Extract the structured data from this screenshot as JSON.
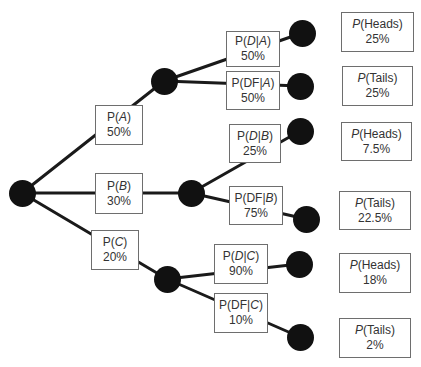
{
  "diagram": {
    "type": "probability-tree",
    "root": {
      "id": "root"
    },
    "level1": [
      {
        "id": "A",
        "label_prefix": "P(",
        "event": "A",
        "label_suffix": ")",
        "value": "50%"
      },
      {
        "id": "B",
        "label_prefix": "P(",
        "event": "B",
        "label_suffix": ")",
        "value": "30%"
      },
      {
        "id": "C",
        "label_prefix": "P(",
        "event": "C",
        "label_suffix": ")",
        "value": "20%"
      }
    ],
    "level2": [
      {
        "id": "D_A",
        "parent": "A",
        "label_prefix": "P(",
        "event": "D",
        "mid": "|",
        "given": "A",
        "label_suffix": ")",
        "value": "50%"
      },
      {
        "id": "DF_A",
        "parent": "A",
        "label_prefix": "P(",
        "event": "DF",
        "mid": "|",
        "given": "A",
        "label_suffix": ")",
        "value": "50%"
      },
      {
        "id": "D_B",
        "parent": "B",
        "label_prefix": "P(",
        "event": "D",
        "mid": "|",
        "given": "B",
        "label_suffix": ")",
        "value": "25%"
      },
      {
        "id": "DF_B",
        "parent": "B",
        "label_prefix": "P(",
        "event": "DF",
        "mid": "|",
        "given": "B",
        "label_suffix": ")",
        "value": "75%"
      },
      {
        "id": "D_C",
        "parent": "C",
        "label_prefix": "P(",
        "event": "D",
        "mid": "|",
        "given": "C",
        "label_suffix": ")",
        "value": "90%"
      },
      {
        "id": "DF_C",
        "parent": "C",
        "label_prefix": "P(",
        "event": "DF",
        "mid": "|",
        "given": "C",
        "label_suffix": ")",
        "value": "10%"
      }
    ],
    "outcomes": [
      {
        "p": "P",
        "label": "(Heads)",
        "value": "25%"
      },
      {
        "p": "P",
        "label": "(Tails)",
        "value": "25%"
      },
      {
        "p": "P",
        "label": "(Heads)",
        "value": "7.5%"
      },
      {
        "p": "P",
        "label": "(Tails)",
        "value": "22.5%"
      },
      {
        "p": "P",
        "label": "(Heads)",
        "value": "18%"
      },
      {
        "p": "P",
        "label": "(Tails)",
        "value": "2%"
      }
    ]
  },
  "colors": {
    "node": "#111111",
    "edge": "#1a1a1a",
    "box_border": "#6e6e6e",
    "text": "#333333"
  }
}
